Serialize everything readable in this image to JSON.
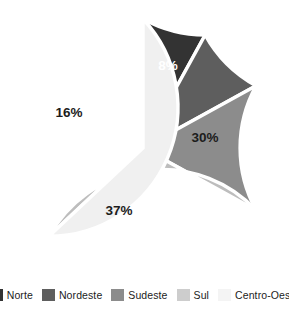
{
  "chart_data": {
    "type": "pie",
    "title": "",
    "subtitle": "",
    "xlabel": "",
    "ylabel": "",
    "grid": false,
    "legend_position": "bottom",
    "start_angle_deg": 0,
    "direction": "counterclockwise",
    "units": "percent",
    "categories": [
      "Norte",
      "Nordeste",
      "Sudeste",
      "Sul",
      "Centro-Oeste"
    ],
    "values": [
      8,
      9,
      16,
      30,
      37
    ],
    "data_labels": [
      "8%",
      "9%",
      "16%",
      "30%",
      "37%"
    ],
    "slices": [
      {
        "label": "Norte",
        "value": 8,
        "data_label": "8%",
        "color": "#333333",
        "label_color": "#ffffff",
        "start_deg": 0,
        "end_deg": 28.8,
        "label_x": 168,
        "label_y": 65
      },
      {
        "label": "Nordeste",
        "value": 9,
        "data_label": "9%",
        "color": "#5e5e5e",
        "label_color": "#ffffff",
        "start_deg": 28.8,
        "end_deg": 61.2,
        "label_x": 117,
        "label_y": 64
      },
      {
        "label": "Sudeste",
        "value": 16,
        "data_label": "16%",
        "color": "#8c8c8c",
        "label_color": "#1c1c1c",
        "start_deg": 61.2,
        "end_deg": 118.8,
        "label_x": 69,
        "label_y": 112
      },
      {
        "label": "Sul",
        "value": 30,
        "data_label": "30%",
        "color": "#bdbdbd",
        "label_color": "#1c1c1c",
        "start_deg": 118.8,
        "end_deg": 226.8,
        "label_x": 205,
        "label_y": 137
      },
      {
        "label": "Centro-Oeste",
        "value": 37,
        "data_label": "37%",
        "color": "#f0f0f0",
        "label_color": "#1c1c1c",
        "start_deg": 226.8,
        "end_deg": 360,
        "label_x": 119,
        "label_y": 210
      }
    ],
    "legend": [
      {
        "label": "Norte",
        "color": "#333333"
      },
      {
        "label": "Nordeste",
        "color": "#5e5e5e"
      },
      {
        "label": "Sudeste",
        "color": "#8c8c8c"
      },
      {
        "label": "Sul",
        "color": "#cdcdcd"
      },
      {
        "label": "Centro-Oeste",
        "color": "#f4f4f4"
      }
    ],
    "geometry": {
      "center_x": 143,
      "center_y": 148,
      "radius": 129,
      "separator_color": "#ffffff"
    }
  }
}
